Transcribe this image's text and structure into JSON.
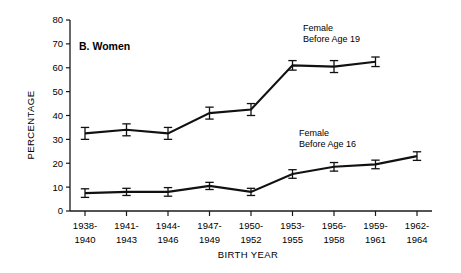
{
  "figure": {
    "panel_label": "B.  Women",
    "y_axis_title": "PERCENTAGE",
    "x_axis_title": "BIRTH YEAR",
    "line_color": "#111111",
    "axis_color": "#1a1a1a",
    "text_color": "#000000",
    "background": "#ffffff"
  },
  "annotations": [
    {
      "name": "series-label-before-age-19",
      "line1": "Female",
      "line2": "Before Age 19",
      "x": 303,
      "y": 31
    },
    {
      "name": "series-label-before-age-16",
      "line1": "Female",
      "line2": "Before Age 16",
      "x": 299,
      "y": 136
    }
  ],
  "chart_data": {
    "type": "line",
    "title": "B.  Women",
    "xlabel": "BIRTH YEAR",
    "ylabel": "PERCENTAGE",
    "ylim": [
      0,
      80
    ],
    "yticks": [
      0,
      10,
      20,
      30,
      40,
      50,
      60,
      70,
      80
    ],
    "grid": false,
    "legend_position": "inline-annotation",
    "error_bars": true,
    "categories": [
      "1938-\n1940",
      "1941-\n1943",
      "1944-\n1946",
      "1947-\n1949",
      "1950-\n1952",
      "1953-\n1955",
      "1956-\n1958",
      "1959-\n1961",
      "1962-\n1964"
    ],
    "category_lines": [
      [
        "1938-",
        "1940"
      ],
      [
        "1941-",
        "1943"
      ],
      [
        "1944-",
        "1946"
      ],
      [
        "1947-",
        "1949"
      ],
      [
        "1950-",
        "1952"
      ],
      [
        "1953-",
        "1955"
      ],
      [
        "1956-",
        "1958"
      ],
      [
        "1959-",
        "1961"
      ],
      [
        "1962-",
        "1964"
      ]
    ],
    "series": [
      {
        "name": "Female Before Age 19",
        "values": [
          32.5,
          34.0,
          32.5,
          41.0,
          42.5,
          61.0,
          60.5,
          62.5,
          null
        ],
        "errors": [
          2.5,
          2.5,
          2.5,
          2.5,
          2.5,
          2.0,
          2.5,
          2.0,
          null
        ]
      },
      {
        "name": "Female Before Age 16",
        "values": [
          7.5,
          8.0,
          8.0,
          10.5,
          8.0,
          15.5,
          18.5,
          19.5,
          23.0
        ],
        "errors": [
          1.8,
          1.5,
          1.8,
          1.5,
          1.5,
          1.8,
          1.8,
          1.8,
          1.8
        ]
      }
    ]
  }
}
